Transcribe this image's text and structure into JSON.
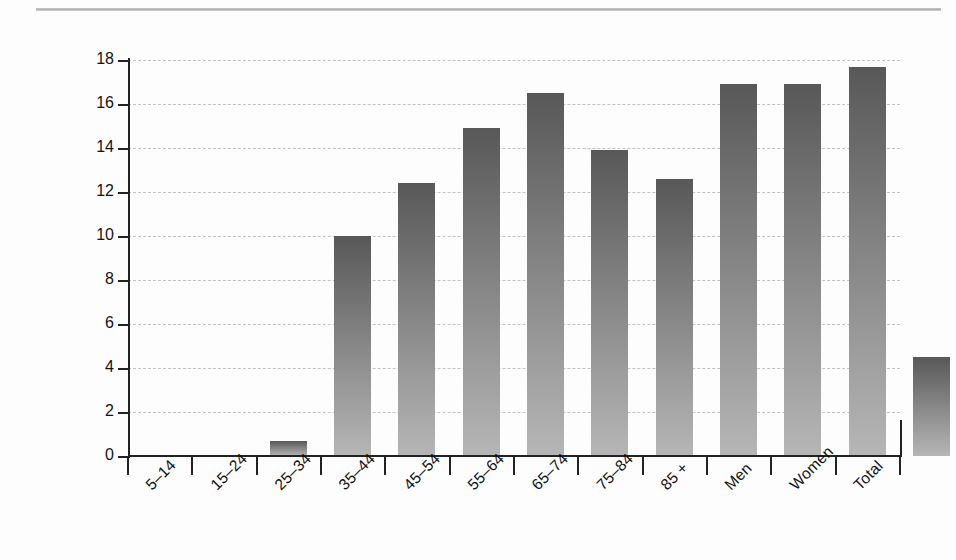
{
  "chart_data": {
    "type": "bar",
    "title": "",
    "subtitle": "",
    "xlabel": "",
    "ylabel": "Suicides per 100,000 population",
    "categories": [
      "5–14",
      "15–24",
      "25–34",
      "35–44",
      "45–54",
      "55–64",
      "65–74",
      "75–84",
      "85 +",
      "Men",
      "Women",
      "Total"
    ],
    "values": [
      0.7,
      10.0,
      12.4,
      14.9,
      16.5,
      13.9,
      12.6,
      16.9,
      16.9,
      17.7,
      4.5,
      11.0
    ],
    "ylim": [
      0,
      18
    ],
    "ytick_labels": [
      "0",
      "2",
      "4",
      "6",
      "8",
      "10",
      "12",
      "14",
      "16",
      "18"
    ],
    "ytick_values": [
      0,
      2,
      4,
      6,
      8,
      10,
      12,
      14,
      16,
      18
    ],
    "grid": true,
    "grid_style": "dashed-horizontal",
    "legend": "none",
    "bar_colors": {
      "gradient_top": "#585858",
      "gradient_bottom": "#b6b6b6",
      "total_flat": "#a9a9a9"
    }
  },
  "figure": {
    "top_rule_color": "#9c9c9c",
    "background": "#fdfdfd"
  }
}
